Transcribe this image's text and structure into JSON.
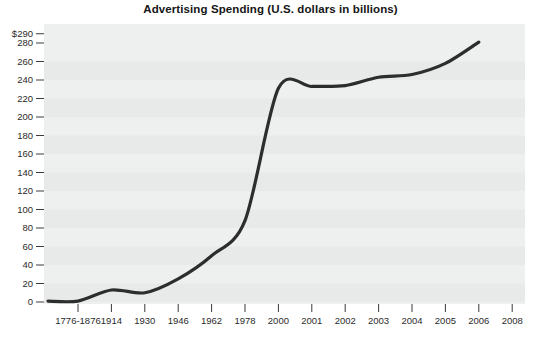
{
  "chart_data": {
    "type": "line",
    "title": "Advertising Spending (U.S. dollars in billions)",
    "xlabel": "",
    "ylabel": "",
    "categories": [
      "1776-1876",
      "1914",
      "1930",
      "1946",
      "1962",
      "1978",
      "2000",
      "2001",
      "2002",
      "2003",
      "2004",
      "2005",
      "2006",
      "2008"
    ],
    "values": [
      1,
      13,
      10,
      25,
      50,
      88,
      231,
      233,
      234,
      243,
      246,
      258,
      281,
      null
    ],
    "series": [
      {
        "name": "Advertising Spending",
        "values": [
          1,
          13,
          10,
          25,
          50,
          88,
          231,
          233,
          234,
          243,
          246,
          258,
          281,
          null
        ]
      }
    ],
    "ytick_labels": [
      "$290",
      "280",
      "260",
      "240",
      "220",
      "200",
      "180",
      "160",
      "140",
      "120",
      "100",
      "80",
      "60",
      "40",
      "20",
      "0"
    ],
    "ytick_values": [
      290,
      280,
      260,
      240,
      220,
      200,
      180,
      160,
      140,
      120,
      100,
      80,
      60,
      40,
      20,
      0
    ],
    "xtick_labels": [
      "1776-1876",
      "1914",
      "1930",
      "1946",
      "1962",
      "1978",
      "2000",
      "2001",
      "2002",
      "2003",
      "2004",
      "2005",
      "2006",
      "2008"
    ],
    "ylim": [
      0,
      290
    ],
    "grid": "horizontal-bands",
    "legend": "none",
    "line_color": "#2d2d2d",
    "plot_background": "#eef0ef",
    "band_color": "#e8eae9"
  },
  "colors": {
    "line": "#2d2d2d",
    "plot_bg": "#eef0ef",
    "band": "#e8eae9",
    "text": "#2b2b2b",
    "title": "#161616"
  }
}
